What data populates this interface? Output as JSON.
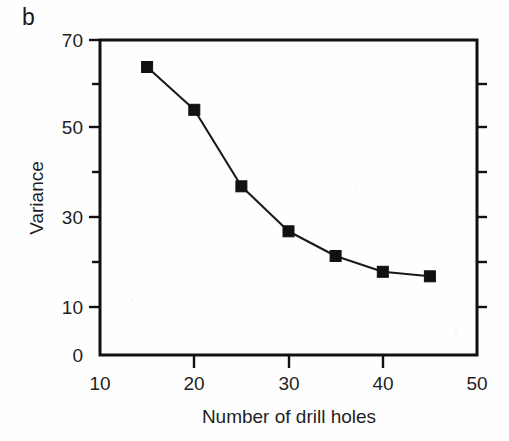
{
  "figure": {
    "panel_label": "b",
    "background_color": "#fefefe",
    "ink_color": "#111111"
  },
  "axes": {
    "y_title": "Variance",
    "x_title": "Number of drill holes",
    "x_tick_labels": [
      "10",
      "20",
      "30",
      "40",
      "50"
    ],
    "y_tick_labels": [
      "0",
      "10",
      "30",
      "50",
      "70"
    ]
  },
  "chart_data": {
    "type": "line",
    "title": "",
    "subtitle": "",
    "panel": "b",
    "xlabel": "Number of drill holes",
    "ylabel": "Variance",
    "xlim": [
      10,
      50
    ],
    "ylim": [
      0,
      70
    ],
    "x_ticks": [
      10,
      20,
      30,
      40,
      50
    ],
    "y_ticks": [
      0,
      10,
      30,
      50,
      70
    ],
    "x_minor_ticks": [
      15,
      25,
      35,
      45
    ],
    "y_minor_ticks": [
      20,
      40,
      60
    ],
    "grid": false,
    "legend": null,
    "legend_position": "none",
    "marker": "filled-square",
    "line_color": "#1a1a1a",
    "marker_color": "#111111",
    "x": [
      15,
      20,
      25,
      30,
      35,
      40,
      45
    ],
    "values": [
      64,
      54.5,
      37.5,
      27.5,
      22,
      18.5,
      17.5
    ],
    "series": [
      {
        "name": "Variance",
        "points": [
          {
            "x": 15,
            "y": 64
          },
          {
            "x": 20,
            "y": 54.5
          },
          {
            "x": 25,
            "y": 37.5
          },
          {
            "x": 30,
            "y": 27.5
          },
          {
            "x": 35,
            "y": 22
          },
          {
            "x": 40,
            "y": 18.5
          },
          {
            "x": 45,
            "y": 17.5
          }
        ]
      }
    ],
    "annotations": []
  }
}
